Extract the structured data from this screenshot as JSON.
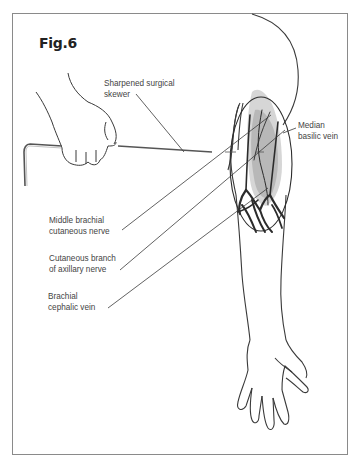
{
  "figure": {
    "title": "Fig.6"
  },
  "labels": [
    {
      "id": "skewer",
      "line1": "Sharpened surgical",
      "line2": "skewer"
    },
    {
      "id": "median-basilic-vein",
      "line1": "Median",
      "line2": "basilic vein"
    },
    {
      "id": "middle-brachial-cutaneous-nerve",
      "line1": "Middle brachial",
      "line2": "cutaneous nerve"
    },
    {
      "id": "cutaneous-branch-axillary-nerve",
      "line1": "Cutaneous branch",
      "line2": "of axillary nerve"
    },
    {
      "id": "brachial-cephalic-vein",
      "line1": "Brachial",
      "line2": "cephalic vein"
    }
  ],
  "colors": {
    "outline": "#3a3a3a",
    "vein_dark": "#2b2b2b",
    "muscle_shade": "#b8b8b8",
    "muscle_light": "#d6d6d6",
    "frame": "#8a8a8a",
    "text": "#444444"
  }
}
